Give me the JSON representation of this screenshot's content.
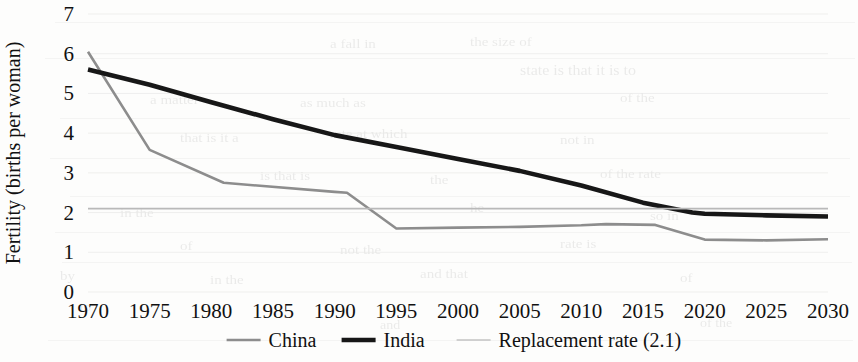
{
  "chart_data": {
    "type": "line",
    "title": "",
    "xlabel": "",
    "ylabel": "Fertility (births per woman)",
    "xlim": [
      1970,
      2030
    ],
    "ylim": [
      0,
      7
    ],
    "ytick_labels": [
      "0",
      "1",
      "2",
      "3",
      "4",
      "5",
      "6",
      "7"
    ],
    "ytick_values": [
      0,
      1,
      2,
      3,
      4,
      5,
      6,
      7
    ],
    "xtick_labels": [
      "1970",
      "1975",
      "1980",
      "1985",
      "1990",
      "1995",
      "2000",
      "2005",
      "2010",
      "2015",
      "2020",
      "2025",
      "2030"
    ],
    "xtick_values": [
      1970,
      1975,
      1980,
      1985,
      1990,
      1995,
      2000,
      2005,
      2010,
      2015,
      2020,
      2025,
      2030
    ],
    "grid": false,
    "legend_position": "bottom",
    "series": [
      {
        "name": "China",
        "color": "#8d8d8d",
        "width": 2.6,
        "x": [
          1970,
          1975,
          1981,
          1990,
          1991,
          1995,
          2000,
          2005,
          2010,
          2012,
          2016,
          2020,
          2025,
          2030
        ],
        "values": [
          6.05,
          3.58,
          2.75,
          2.52,
          2.5,
          1.6,
          1.62,
          1.64,
          1.68,
          1.71,
          1.69,
          1.32,
          1.3,
          1.33
        ]
      },
      {
        "name": "India",
        "color": "#171717",
        "width": 4.6,
        "x": [
          1970,
          1975,
          1980,
          1985,
          1990,
          1995,
          2000,
          2005,
          2010,
          2015,
          2019,
          2020,
          2025,
          2030
        ],
        "values": [
          5.6,
          5.22,
          4.78,
          4.35,
          3.95,
          3.65,
          3.35,
          3.05,
          2.68,
          2.25,
          2.0,
          1.97,
          1.93,
          1.9
        ]
      },
      {
        "name": "Replacement rate (2.1)",
        "color": "#b9b9b9",
        "width": 1.6,
        "x": [
          1970,
          2030
        ],
        "values": [
          2.1,
          2.1
        ]
      }
    ],
    "legend": [
      {
        "label": "China",
        "color": "#8d8d8d",
        "width": 2.6
      },
      {
        "label": "India",
        "color": "#171717",
        "width": 4.6
      },
      {
        "label": "Replacement rate (2.1)",
        "color": "#c3c3c3",
        "width": 1.6
      }
    ]
  },
  "ghost": {
    "words": [
      {
        "t": "a fall in",
        "x": 330,
        "y": 36,
        "s": 15
      },
      {
        "t": "the size of",
        "x": 470,
        "y": 34,
        "s": 15
      },
      {
        "t": "state is that it is to",
        "x": 520,
        "y": 62,
        "s": 16
      },
      {
        "t": "a matter",
        "x": 150,
        "y": 92,
        "s": 15
      },
      {
        "t": "as much as",
        "x": 300,
        "y": 95,
        "s": 15
      },
      {
        "t": "of the",
        "x": 620,
        "y": 90,
        "s": 15
      },
      {
        "t": "that is it a",
        "x": 180,
        "y": 130,
        "s": 15
      },
      {
        "t": "rate at which",
        "x": 330,
        "y": 126,
        "s": 15
      },
      {
        "t": "not in",
        "x": 560,
        "y": 132,
        "s": 15
      },
      {
        "t": "is that is",
        "x": 260,
        "y": 168,
        "s": 15
      },
      {
        "t": "the",
        "x": 430,
        "y": 172,
        "s": 15
      },
      {
        "t": "of the rate",
        "x": 600,
        "y": 166,
        "s": 15
      },
      {
        "t": "in the",
        "x": 120,
        "y": 205,
        "s": 15
      },
      {
        "t": "he",
        "x": 470,
        "y": 200,
        "s": 15
      },
      {
        "t": "so in",
        "x": 650,
        "y": 208,
        "s": 15
      },
      {
        "t": "of",
        "x": 180,
        "y": 238,
        "s": 15
      },
      {
        "t": "not the",
        "x": 340,
        "y": 242,
        "s": 15
      },
      {
        "t": "rate is",
        "x": 560,
        "y": 236,
        "s": 15
      },
      {
        "t": "by",
        "x": 60,
        "y": 268,
        "s": 15
      },
      {
        "t": "in the",
        "x": 210,
        "y": 272,
        "s": 15
      },
      {
        "t": "and that",
        "x": 420,
        "y": 266,
        "s": 15
      },
      {
        "t": "of",
        "x": 680,
        "y": 270,
        "s": 15
      },
      {
        "t": "to",
        "x": 80,
        "y": 300,
        "s": 14
      },
      {
        "t": "and",
        "x": 380,
        "y": 318,
        "s": 14
      },
      {
        "t": "of the",
        "x": 700,
        "y": 316,
        "s": 14
      }
    ],
    "lines": [
      {
        "x": 55,
        "y": 22,
        "w": 800
      },
      {
        "x": 45,
        "y": 58,
        "w": 810
      },
      {
        "x": 60,
        "y": 118,
        "w": 790
      },
      {
        "x": 50,
        "y": 158,
        "w": 800
      },
      {
        "x": 70,
        "y": 196,
        "w": 780
      },
      {
        "x": 55,
        "y": 232,
        "w": 795
      },
      {
        "x": 62,
        "y": 262,
        "w": 790
      },
      {
        "x": 48,
        "y": 340,
        "w": 805
      }
    ]
  }
}
